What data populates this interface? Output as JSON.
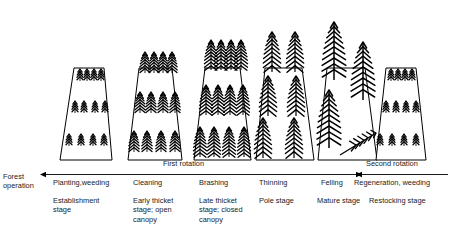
{
  "figure": {
    "background_color": "#ffffff",
    "ink_color": "#000000"
  },
  "axis": {
    "row_label_line1": "Forest",
    "row_label_line2": "operation",
    "first_rotation_label": "First rotation",
    "second_rotation_label": "Second rotation"
  },
  "operations": [
    {
      "label": "Planting,weeding",
      "x": 66
    },
    {
      "label": "Cleaning",
      "x": 137
    },
    {
      "label": "Brashing",
      "x": 207
    },
    {
      "label": "Thinning",
      "x": 247
    },
    {
      "label": "Felling",
      "x": 293
    },
    {
      "label": "Regeneration, weeding",
      "x": 325
    }
  ],
  "stages": [
    {
      "lines": [
        "Establishment",
        "stage"
      ],
      "x": 66,
      "width": 68
    },
    {
      "lines": [
        "Early thicket",
        "stage; open",
        "canopy"
      ],
      "x": 137,
      "width": 66
    },
    {
      "lines": [
        "Late thicket",
        "stage; closed",
        "canopy"
      ],
      "x": 207,
      "width": 66
    },
    {
      "lines": [
        "Pole stage"
      ],
      "x": 247,
      "width": 60
    },
    {
      "lines": [
        "Mature stage"
      ],
      "x": 293,
      "width": 62
    },
    {
      "lines": [
        "Restocking stage"
      ],
      "x": 358,
      "width": 80
    }
  ],
  "plots": [
    {
      "name": "planting-weeding-plot",
      "stage": "Establishment stage",
      "tree_size": "seedling",
      "tree_rows": 3,
      "trees_per_row": 4,
      "canopy": "open"
    },
    {
      "name": "cleaning-plot",
      "stage": "Early thicket stage; open canopy",
      "tree_size": "small",
      "tree_rows": 3,
      "trees_per_row": 4,
      "canopy": "open"
    },
    {
      "name": "brashing-plot",
      "stage": "Late thicket stage; closed canopy",
      "tree_size": "medium",
      "tree_rows": 3,
      "trees_per_row": 4,
      "canopy": "closed"
    },
    {
      "name": "thinning-plot",
      "stage": "Pole stage",
      "tree_size": "large",
      "tree_rows": 3,
      "trees_per_row": 2,
      "canopy": "thinned"
    },
    {
      "name": "felling-plot",
      "stage": "Mature stage",
      "tree_size": "mature",
      "tree_rows": 2,
      "trees_per_row": 2,
      "canopy": "felled",
      "has_felled_tree": true
    },
    {
      "name": "regeneration-plot",
      "stage": "Restocking stage",
      "tree_size": "seedling",
      "tree_rows": 3,
      "trees_per_row": 4,
      "canopy": "open"
    }
  ]
}
